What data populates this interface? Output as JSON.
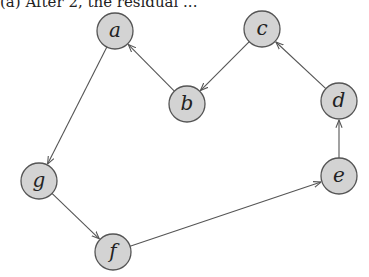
{
  "caption": "(a) After 2, the residual ...",
  "graph": {
    "nodes": [
      {
        "id": "a",
        "label": "a"
      },
      {
        "id": "b",
        "label": "b"
      },
      {
        "id": "c",
        "label": "c"
      },
      {
        "id": "d",
        "label": "d"
      },
      {
        "id": "e",
        "label": "e"
      },
      {
        "id": "f",
        "label": "f"
      },
      {
        "id": "g",
        "label": "g"
      }
    ],
    "edges": [
      {
        "from": "a",
        "to": "g"
      },
      {
        "from": "g",
        "to": "f"
      },
      {
        "from": "f",
        "to": "e"
      },
      {
        "from": "e",
        "to": "d"
      },
      {
        "from": "d",
        "to": "c"
      },
      {
        "from": "c",
        "to": "b"
      },
      {
        "from": "b",
        "to": "a"
      }
    ],
    "node_fill": "#d3d3d3",
    "stroke_color": "#555555"
  }
}
